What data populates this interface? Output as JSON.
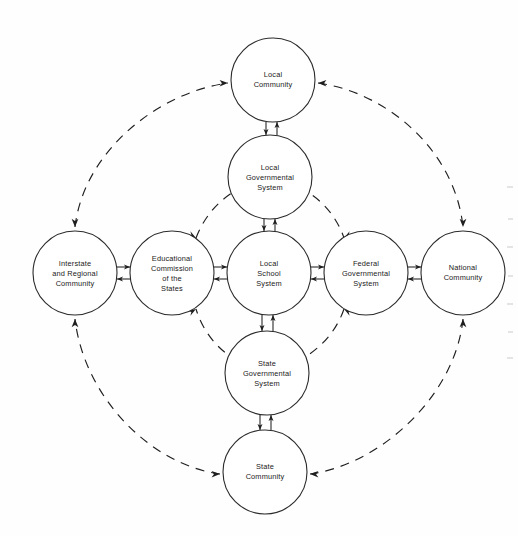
{
  "diagram": {
    "background_color": "#fefefe",
    "line_color": "#1f1f1f",
    "node_fill": "#ffffff",
    "nodes": [
      {
        "id": "local-community",
        "label_lines": [
          "Local",
          "Community"
        ],
        "line1": "Local",
        "line2": "Community",
        "line3": "",
        "cx": 273,
        "cy": 80,
        "r": 42
      },
      {
        "id": "local-governmental-system",
        "label_lines": [
          "Local",
          "Governmental",
          "System"
        ],
        "line1": "Local",
        "line2": "Governmental",
        "line3": "System",
        "cx": 270,
        "cy": 177,
        "r": 42
      },
      {
        "id": "interstate-and-regional-community",
        "label_lines": [
          "Interstate",
          "and Regional",
          "Community"
        ],
        "line1": "Interstate",
        "line2": "and Regional",
        "line3": "Community",
        "cx": 75,
        "cy": 273,
        "r": 42
      },
      {
        "id": "educational-commission-of-the-states",
        "label_lines": [
          "Educational",
          "Commission",
          "of the",
          "States"
        ],
        "line1": "Educational",
        "line2": "Commission",
        "line3": "of the",
        "line4": "States",
        "cx": 172,
        "cy": 273,
        "r": 42
      },
      {
        "id": "local-school-system",
        "label_lines": [
          "Local",
          "School",
          "System"
        ],
        "line1": "Local",
        "line2": "School",
        "line3": "System",
        "cx": 269,
        "cy": 273,
        "r": 42
      },
      {
        "id": "federal-governmental-system",
        "label_lines": [
          "Federal",
          "Governmental",
          "System"
        ],
        "line1": "Federal",
        "line2": "Governmental",
        "line3": "System",
        "cx": 366,
        "cy": 273,
        "r": 42
      },
      {
        "id": "national-community",
        "label_lines": [
          "National",
          "Community"
        ],
        "line1": "National",
        "line2": "Community",
        "line3": "",
        "cx": 463,
        "cy": 273,
        "r": 42
      },
      {
        "id": "state-governmental-system",
        "label_lines": [
          "State",
          "Governmental",
          "System"
        ],
        "line1": "State",
        "line2": "Governmental",
        "line3": "System",
        "cx": 267,
        "cy": 373,
        "r": 42
      },
      {
        "id": "state-community",
        "label_lines": [
          "State",
          "Community"
        ],
        "line1": "State",
        "line2": "Community",
        "line3": "",
        "cx": 265,
        "cy": 472,
        "r": 42
      }
    ],
    "solid_links": [
      {
        "from": "local-community",
        "to": "local-governmental-system",
        "style": "double-arrow-vertical"
      },
      {
        "from": "local-governmental-system",
        "to": "local-school-system",
        "style": "double-arrow-vertical"
      },
      {
        "from": "local-school-system",
        "to": "state-governmental-system",
        "style": "double-arrow-vertical"
      },
      {
        "from": "state-governmental-system",
        "to": "state-community",
        "style": "double-arrow-vertical"
      },
      {
        "from": "interstate-and-regional-community",
        "to": "educational-commission-of-the-states",
        "style": "double-arrow-horizontal"
      },
      {
        "from": "educational-commission-of-the-states",
        "to": "local-school-system",
        "style": "double-arrow-horizontal"
      },
      {
        "from": "local-school-system",
        "to": "federal-governmental-system",
        "style": "double-arrow-horizontal"
      },
      {
        "from": "federal-governmental-system",
        "to": "national-community",
        "style": "double-arrow-horizontal"
      }
    ],
    "dashed_links": [
      {
        "from": "educational-commission-of-the-states",
        "to": "local-governmental-system",
        "style": "dashed-arc-bidirectional"
      },
      {
        "from": "local-governmental-system",
        "to": "federal-governmental-system",
        "style": "dashed-arc-bidirectional"
      },
      {
        "from": "federal-governmental-system",
        "to": "state-governmental-system",
        "style": "dashed-arc-bidirectional"
      },
      {
        "from": "state-governmental-system",
        "to": "educational-commission-of-the-states",
        "style": "dashed-arc-bidirectional"
      },
      {
        "from": "interstate-and-regional-community",
        "to": "local-community",
        "style": "dashed-arc-bidirectional"
      },
      {
        "from": "local-community",
        "to": "national-community",
        "style": "dashed-arc-bidirectional"
      },
      {
        "from": "national-community",
        "to": "state-community",
        "style": "dashed-arc-bidirectional"
      },
      {
        "from": "state-community",
        "to": "interstate-and-regional-community",
        "style": "dashed-arc-bidirectional"
      }
    ]
  }
}
